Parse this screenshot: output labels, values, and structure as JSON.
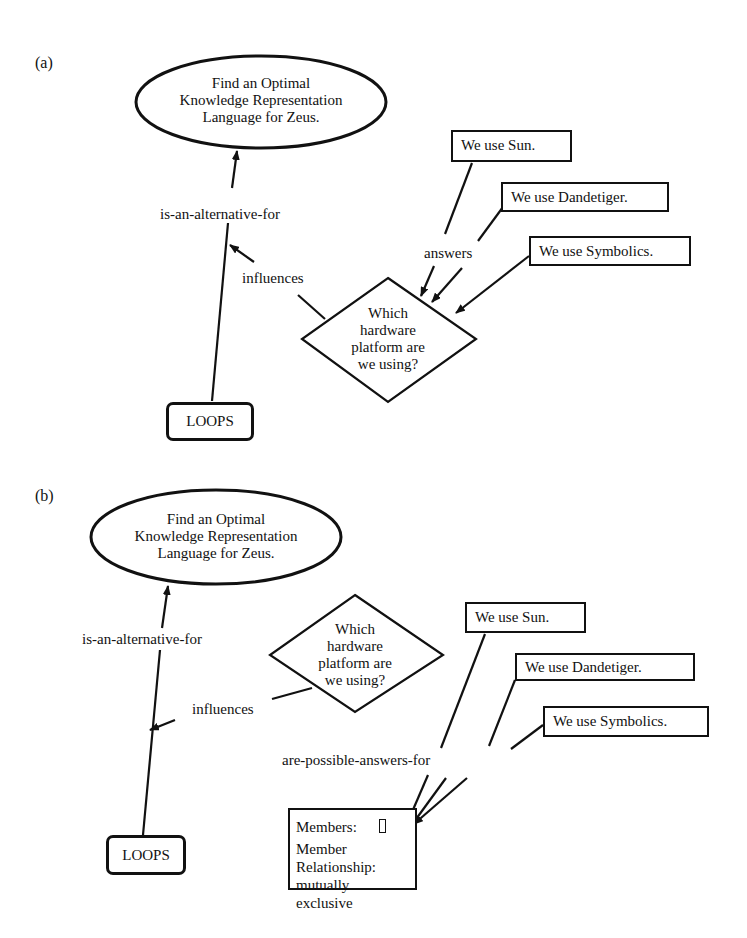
{
  "panel_a": {
    "label": "(a)",
    "goal": [
      "Find an Optimal",
      "Knowledge Representation",
      "Language for Zeus."
    ],
    "question": [
      "Which",
      "hardware",
      "platform are",
      "we using?"
    ],
    "answers": [
      "We use  Sun.",
      "We use Dandetiger.",
      "We use Symbolics."
    ],
    "alternative": "LOOPS",
    "edges": {
      "alternative_for": "is-an-alternative-for",
      "influences": "influences",
      "answers": "answers"
    }
  },
  "panel_b": {
    "label": "(b)",
    "goal": [
      "Find an Optimal",
      "Knowledge Representation",
      "Language for Zeus."
    ],
    "question": [
      "Which",
      "hardware",
      "platform are",
      "we using?"
    ],
    "answers": [
      "We use  Sun.",
      "We use Dandetiger.",
      "We use Symbolics."
    ],
    "alternative": "LOOPS",
    "set_node": {
      "members_label": "Members:",
      "relationship_label": "Member Relationship:",
      "relationship_value": "mutually exclusive"
    },
    "edges": {
      "alternative_for": "is-an-alternative-for",
      "influences": "influences",
      "possible_answers": "are-possible-answers-for"
    }
  }
}
